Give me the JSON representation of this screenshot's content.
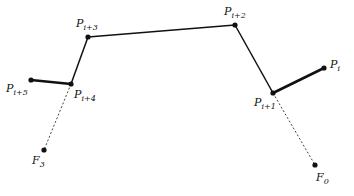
{
  "diagram": {
    "points": [
      {
        "id": "Pi5",
        "name": "P",
        "sub": "i+5",
        "x": 31,
        "y": 80,
        "lx": 6,
        "ly": 92
      },
      {
        "id": "Pi4",
        "name": "P",
        "sub": "i+4",
        "x": 71,
        "y": 84,
        "lx": 74,
        "ly": 98
      },
      {
        "id": "Pi3",
        "name": "P",
        "sub": "i+3",
        "x": 88,
        "y": 37,
        "lx": 76,
        "ly": 27
      },
      {
        "id": "Pi2",
        "name": "P",
        "sub": "i+2",
        "x": 235,
        "y": 25,
        "lx": 224,
        "ly": 15
      },
      {
        "id": "Pi1",
        "name": "P",
        "sub": "i+1",
        "x": 273,
        "y": 93,
        "lx": 254,
        "ly": 106
      },
      {
        "id": "Pi",
        "name": "P",
        "sub": "i",
        "x": 324,
        "y": 68,
        "lx": 330,
        "ly": 68
      },
      {
        "id": "F3",
        "name": "F",
        "sub": "3",
        "x": 44,
        "y": 150,
        "lx": 32,
        "ly": 164
      },
      {
        "id": "F0",
        "name": "F",
        "sub": "0",
        "x": 315,
        "y": 165,
        "lx": 316,
        "ly": 181
      }
    ],
    "thick_segments": [
      [
        "Pi5",
        "Pi4"
      ],
      [
        "Pi1",
        "Pi"
      ]
    ],
    "solid_segments": [
      [
        "Pi4",
        "Pi3"
      ],
      [
        "Pi3",
        "Pi2"
      ],
      [
        "Pi2",
        "Pi1"
      ]
    ],
    "dashed_segments": [
      [
        "Pi4",
        "F3"
      ],
      [
        "Pi1",
        "F0"
      ]
    ],
    "colors": {
      "line": "#111111",
      "dashed": "#444444"
    }
  }
}
